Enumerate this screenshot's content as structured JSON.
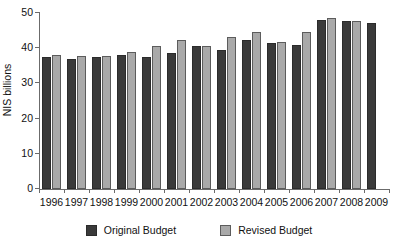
{
  "chart_data": {
    "type": "bar",
    "title": "",
    "xlabel": "",
    "ylabel": "NIS billions",
    "ylim": [
      0,
      50
    ],
    "yticks": [
      0,
      10,
      20,
      30,
      40,
      50
    ],
    "grid": false,
    "legend_position": "bottom",
    "categories": [
      "1996",
      "1997",
      "1998",
      "1999",
      "2000",
      "2001",
      "2002",
      "2003",
      "2004",
      "2005",
      "2006",
      "2007",
      "2008",
      "2009"
    ],
    "series": [
      {
        "name": "Original Budget",
        "color": "#3a3a3a",
        "values": [
          37.6,
          37.0,
          37.6,
          38.1,
          37.4,
          38.5,
          40.6,
          39.5,
          42.2,
          41.5,
          41.0,
          47.9,
          47.6,
          47.3
        ]
      },
      {
        "name": "Revised Budget",
        "color": "#a9a9a9",
        "values": [
          38.1,
          37.9,
          37.9,
          38.8,
          40.5,
          42.2,
          40.5,
          43.2,
          44.5,
          41.9,
          44.7,
          48.5,
          47.8,
          null
        ]
      }
    ]
  },
  "axes": {
    "y_title": "NIS billions",
    "y_tick_labels": [
      "0",
      "10",
      "20",
      "30",
      "40",
      "50"
    ],
    "x_tick_labels": [
      "1996",
      "1997",
      "1998",
      "1999",
      "2000",
      "2001",
      "2002",
      "2003",
      "2004",
      "2005",
      "2006",
      "2007",
      "2008",
      "2009"
    ]
  },
  "legend": {
    "items": [
      {
        "label": "Original Budget",
        "color": "#3a3a3a"
      },
      {
        "label": "Revised Budget",
        "color": "#a9a9a9"
      }
    ]
  }
}
